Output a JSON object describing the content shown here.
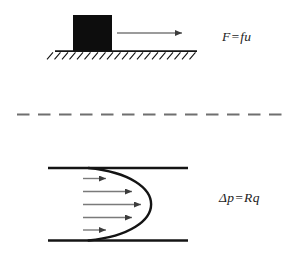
{
  "figure": {
    "friction_panel": {
      "equation": "F=fu"
    },
    "flow_panel": {
      "equation": "Δp=Rq"
    }
  },
  "colors": {
    "background": "#ffffff",
    "ink": "#141414",
    "block_fill": "#0d0d0d",
    "arrow_shaft": "#7a7a7a",
    "arrow_head": "#3c3c3c",
    "dash": "#6f6f6f",
    "label_text": "#1c1c1c"
  }
}
